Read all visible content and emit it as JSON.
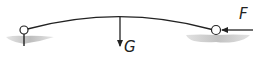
{
  "diagram": {
    "type": "statics free-body sketch",
    "elements": {
      "beam": {
        "shape": "curved arch",
        "color": "#222222"
      },
      "left_support": {
        "type": "pin",
        "ground_color": "#c8c8c8"
      },
      "right_support": {
        "type": "roller/joint",
        "ground_color": "#c8c8c8"
      }
    },
    "forces": [
      {
        "id": "weight",
        "label": "G",
        "direction": "down"
      },
      {
        "id": "applied",
        "label": "F",
        "direction": "left"
      }
    ]
  }
}
